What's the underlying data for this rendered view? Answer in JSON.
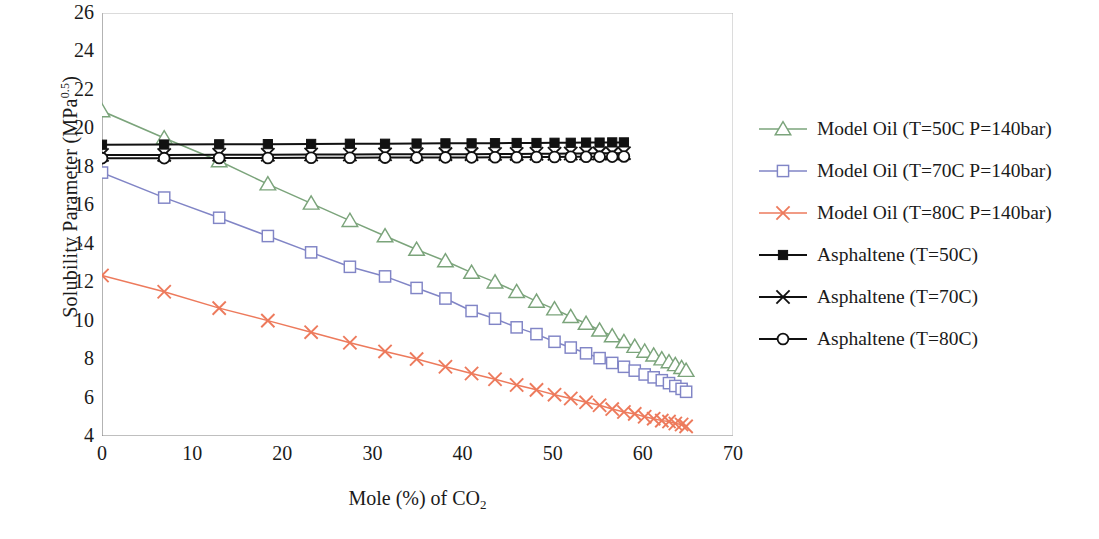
{
  "chart_data": {
    "type": "line",
    "title": "",
    "xlabel": "Mole (%) of CO2",
    "xlabel_main": "Mole (%) of CO",
    "xlabel_sub": "2",
    "ylabel_main": "Solubility Parameter (MPa",
    "ylabel_sup": "0.5",
    "ylabel_tail": ")",
    "ylabel": "Solubility Parameter (MPa^0.5)",
    "xlim": [
      0,
      70
    ],
    "ylim": [
      4,
      26
    ],
    "xticks": [
      0,
      10,
      20,
      30,
      40,
      50,
      60,
      70
    ],
    "yticks": [
      4,
      6,
      8,
      10,
      12,
      14,
      16,
      18,
      20,
      22,
      24,
      26
    ],
    "grid": false,
    "legend_position": "right",
    "series": [
      {
        "name": "Model Oil (T=50C P=140bar)",
        "color": "#7ba47b",
        "marker": "triangle",
        "x": [
          0.0,
          6.9,
          13.0,
          18.4,
          23.2,
          27.5,
          31.4,
          34.9,
          38.1,
          41.0,
          43.6,
          46.0,
          48.2,
          50.2,
          52.0,
          53.7,
          55.2,
          56.6,
          57.9,
          59.1,
          60.2,
          61.2,
          62.1,
          62.9,
          63.6,
          64.3,
          64.8
        ],
        "y": [
          20.9,
          19.5,
          18.3,
          17.1,
          16.1,
          15.2,
          14.4,
          13.7,
          13.1,
          12.5,
          12.0,
          11.5,
          11.0,
          10.6,
          10.2,
          9.85,
          9.5,
          9.2,
          8.9,
          8.65,
          8.4,
          8.2,
          8.0,
          7.85,
          7.7,
          7.55,
          7.4
        ]
      },
      {
        "name": "Model Oil (T=70C P=140bar)",
        "color": "#8185c6",
        "marker": "square-open",
        "x": [
          0.0,
          6.9,
          13.0,
          18.4,
          23.2,
          27.5,
          31.4,
          34.9,
          38.1,
          41.0,
          43.6,
          46.0,
          48.2,
          50.2,
          52.0,
          53.7,
          55.2,
          56.6,
          57.9,
          59.1,
          60.2,
          61.2,
          62.1,
          62.9,
          63.6,
          64.3,
          64.8
        ],
        "y": [
          17.7,
          16.4,
          15.35,
          14.4,
          13.55,
          12.8,
          12.3,
          11.7,
          11.15,
          10.5,
          10.1,
          9.65,
          9.3,
          8.9,
          8.6,
          8.3,
          8.05,
          7.8,
          7.6,
          7.4,
          7.2,
          7.05,
          6.9,
          6.75,
          6.6,
          6.45,
          6.3
        ]
      },
      {
        "name": "Model Oil (T=80C P=140bar)",
        "color": "#ed7a5c",
        "marker": "x",
        "x": [
          0.0,
          6.9,
          13.0,
          18.4,
          23.2,
          27.5,
          31.4,
          34.9,
          38.1,
          41.0,
          43.6,
          46.0,
          48.2,
          50.2,
          52.0,
          53.7,
          55.2,
          56.6,
          57.9,
          59.1,
          60.2,
          61.2,
          62.1,
          62.9,
          63.6,
          64.3,
          64.8
        ],
        "y": [
          12.35,
          11.5,
          10.65,
          10.0,
          9.4,
          8.85,
          8.4,
          8.0,
          7.6,
          7.25,
          6.95,
          6.65,
          6.4,
          6.15,
          5.95,
          5.75,
          5.6,
          5.4,
          5.25,
          5.15,
          5.0,
          4.9,
          4.8,
          4.75,
          4.65,
          4.6,
          4.5
        ]
      },
      {
        "name": "Asphaltene (T=50C)",
        "color": "#111111",
        "marker": "square-filled",
        "x": [
          0.0,
          6.9,
          13.0,
          18.4,
          23.2,
          27.5,
          31.4,
          34.9,
          38.1,
          41.0,
          43.6,
          46.0,
          48.2,
          50.2,
          52.0,
          53.7,
          55.2,
          56.6,
          57.9
        ],
        "y": [
          19.15,
          19.16,
          19.17,
          19.18,
          19.19,
          19.2,
          19.2,
          19.21,
          19.22,
          19.22,
          19.23,
          19.24,
          19.24,
          19.25,
          19.25,
          19.26,
          19.26,
          19.27,
          19.27
        ]
      },
      {
        "name": "Asphaltene (T=70C)",
        "color": "#111111",
        "marker": "x",
        "x": [
          0.0,
          6.9,
          13.0,
          18.4,
          23.2,
          27.5,
          31.4,
          34.9,
          38.1,
          41.0,
          43.6,
          46.0,
          48.2,
          50.2,
          52.0,
          53.7,
          55.2,
          56.6,
          57.9
        ],
        "y": [
          18.62,
          18.62,
          18.63,
          18.63,
          18.64,
          18.64,
          18.65,
          18.65,
          18.66,
          18.66,
          18.67,
          18.67,
          18.68,
          18.68,
          18.69,
          18.69,
          18.7,
          18.7,
          18.71
        ]
      },
      {
        "name": "Asphaltene (T=80C)",
        "color": "#111111",
        "marker": "circle-open",
        "x": [
          0.0,
          6.9,
          13.0,
          18.4,
          23.2,
          27.5,
          31.4,
          34.9,
          38.1,
          41.0,
          43.6,
          46.0,
          48.2,
          50.2,
          52.0,
          53.7,
          55.2,
          56.6,
          57.9
        ],
        "y": [
          18.45,
          18.45,
          18.46,
          18.46,
          18.47,
          18.47,
          18.48,
          18.48,
          18.49,
          18.49,
          18.5,
          18.5,
          18.51,
          18.51,
          18.52,
          18.52,
          18.53,
          18.53,
          18.54
        ]
      }
    ]
  }
}
